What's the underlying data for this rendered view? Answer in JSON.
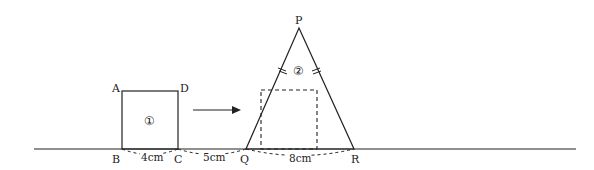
{
  "diagram": {
    "type": "geometry-figure",
    "points": {
      "A": "A",
      "B": "B",
      "C": "C",
      "D": "D",
      "P": "P",
      "Q": "Q",
      "R": "R"
    },
    "shapes": {
      "square_label": "①",
      "triangle_label": "②"
    },
    "measurements": {
      "BC": "4cm",
      "CQ": "5cm",
      "QR": "8cm"
    },
    "notes": {
      "triangle_equal_sides": "PQ = PR (tick marks)",
      "motion": "Square ① moves right along the line toward triangle ②"
    },
    "colors": {
      "stroke": "#222222",
      "background": "#ffffff"
    }
  }
}
